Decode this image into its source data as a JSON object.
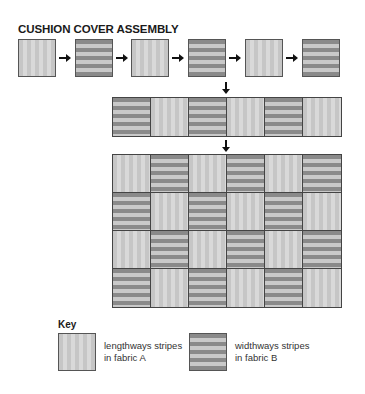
{
  "title": "CUSHION COVER ASSEMBLY",
  "stages": {
    "strip_sequence": [
      "V",
      "H",
      "V",
      "H",
      "V",
      "H"
    ],
    "joined_strip": [
      "H",
      "V",
      "H",
      "V",
      "H",
      "V"
    ],
    "final_panel": [
      [
        "V",
        "H",
        "V",
        "H",
        "V",
        "H"
      ],
      [
        "H",
        "V",
        "H",
        "V",
        "H",
        "V"
      ],
      [
        "V",
        "H",
        "V",
        "H",
        "V",
        "H"
      ],
      [
        "H",
        "V",
        "H",
        "V",
        "H",
        "V"
      ]
    ]
  },
  "key": {
    "label": "Key",
    "items": [
      {
        "pattern": "V",
        "line1": "lengthways stripes",
        "line2": "in fabric A"
      },
      {
        "pattern": "H",
        "line1": "widthways stripes",
        "line2": "in fabric B"
      }
    ]
  },
  "colors": {
    "fabric_a_base": "#c6c6c6",
    "fabric_a_stripe": "#d9d9d9",
    "fabric_b_dark": "#8a8a8a",
    "fabric_b_light": "#c9c9c9",
    "outline": "#444444"
  }
}
